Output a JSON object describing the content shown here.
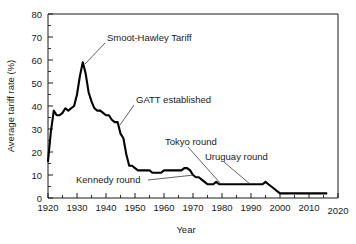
{
  "chart_data": {
    "type": "line",
    "title": "",
    "xlabel": "Year",
    "ylabel": "Average tariff rate (%)",
    "xlim": [
      1920,
      2020
    ],
    "ylim": [
      0,
      80
    ],
    "xticks": [
      1920,
      1930,
      1940,
      1950,
      1960,
      1970,
      1980,
      1990,
      2000,
      2010,
      2020
    ],
    "yticks": [
      0,
      10,
      20,
      30,
      40,
      50,
      60,
      70,
      80
    ],
    "xtick_labels": [
      "1920",
      "1930",
      "1940",
      "1950",
      "1960",
      "1970",
      "1980",
      "1990",
      "2000",
      "2010",
      "2020"
    ],
    "ytick_labels": [
      "0",
      "10",
      "20",
      "30",
      "40",
      "50",
      "60",
      "70",
      "80"
    ],
    "x_minor_step": 5,
    "y_minor_step": 5,
    "grid": false,
    "legend": "none",
    "series": [
      {
        "name": "Average tariff rate",
        "color": "#000000",
        "x": [
          1920,
          1921,
          1922,
          1923,
          1924,
          1925,
          1926,
          1927,
          1928,
          1929,
          1930,
          1931,
          1932,
          1933,
          1934,
          1935,
          1936,
          1937,
          1938,
          1939,
          1940,
          1941,
          1942,
          1943,
          1944,
          1945,
          1946,
          1947,
          1948,
          1949,
          1950,
          1951,
          1952,
          1953,
          1954,
          1955,
          1956,
          1957,
          1958,
          1959,
          1960,
          1961,
          1962,
          1963,
          1964,
          1965,
          1966,
          1967,
          1968,
          1969,
          1970,
          1971,
          1972,
          1973,
          1974,
          1975,
          1976,
          1977,
          1978,
          1979,
          1980,
          1981,
          1982,
          1983,
          1984,
          1985,
          1986,
          1987,
          1988,
          1989,
          1990,
          1991,
          1992,
          1993,
          1994,
          1995,
          1996,
          1997,
          1998,
          1999,
          2000,
          2001,
          2002,
          2003,
          2004,
          2005,
          2006,
          2007,
          2008,
          2009,
          2010,
          2011,
          2012,
          2013,
          2014,
          2015,
          2016
        ],
        "values": [
          16,
          29,
          38,
          36,
          36,
          37,
          39,
          38,
          39,
          40,
          45,
          53,
          59,
          54,
          46,
          42,
          39,
          38,
          38,
          37,
          36,
          36,
          34,
          33,
          33,
          28,
          26,
          19,
          14,
          14,
          13,
          12,
          12,
          12,
          12,
          12,
          11,
          11,
          11,
          11,
          12,
          12,
          12,
          12,
          12,
          12,
          12,
          13,
          13,
          12,
          10,
          9,
          9,
          8,
          7,
          6,
          6,
          6,
          7,
          6,
          6,
          6,
          6,
          6,
          6,
          6,
          6,
          6,
          6,
          6,
          6,
          6,
          6,
          6,
          6,
          7,
          6,
          5,
          4,
          3,
          2,
          2,
          2,
          2,
          2,
          2,
          2,
          2,
          2,
          2,
          2,
          2,
          2,
          2,
          2,
          2,
          2
        ]
      }
    ],
    "annotations": [
      {
        "id": "smoot-hawley",
        "label": "Smoot-Hawley Tariff",
        "target_x": 1932,
        "target_y": 59
      },
      {
        "id": "gatt-established",
        "label": "GATT established",
        "target_x": 1947,
        "target_y": 33
      },
      {
        "id": "kennedy-round",
        "label": "Kennedy round",
        "target_x": 1968,
        "target_y": 13
      },
      {
        "id": "tokyo-round",
        "label": "Tokyo round",
        "target_x": 1979,
        "target_y": 6
      },
      {
        "id": "uruguay-round",
        "label": "Uruguay round",
        "target_x": 1990,
        "target_y": 6
      }
    ]
  },
  "axes": {
    "x_title": "Year",
    "y_title": "Average tariff rate (%)"
  },
  "annotations": {
    "smoot_hawley": "Smoot-Hawley Tariff",
    "gatt": "GATT established",
    "kennedy": "Kennedy round",
    "tokyo": "Tokyo round",
    "uruguay": "Uruguay round"
  },
  "xtick_labels": {
    "t0": "1920",
    "t1": "1930",
    "t2": "1940",
    "t3": "1950",
    "t4": "1960",
    "t5": "1970",
    "t6": "1980",
    "t7": "1990",
    "t8": "2000",
    "t9": "2010",
    "t10": "2020"
  },
  "ytick_labels": {
    "t0": "0",
    "t1": "10",
    "t2": "20",
    "t3": "30",
    "t4": "40",
    "t5": "50",
    "t6": "60",
    "t7": "70",
    "t8": "80"
  },
  "colors": {
    "line": "#000000",
    "axis": "#1a1a1a",
    "background": "#ffffff",
    "leader": "#3a3a3a"
  }
}
